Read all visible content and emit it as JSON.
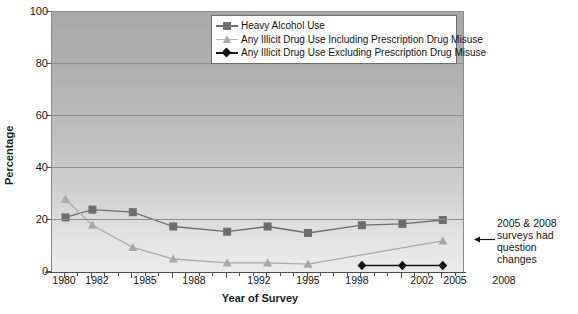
{
  "chart_data": {
    "type": "line",
    "title": "",
    "xlabel": "Year of Survey",
    "ylabel": "Percentage",
    "ylim": [
      0,
      100
    ],
    "yticks": [
      0,
      20,
      40,
      60,
      80,
      100
    ],
    "grid": true,
    "legend_position": "top-center",
    "categories": [
      "1980",
      "1982",
      "1985",
      "1988",
      "1992",
      "1995",
      "1998",
      "2002",
      "2005",
      "2008"
    ],
    "x": [
      1980,
      1982,
      1985,
      1988,
      1992,
      1995,
      1998,
      2002,
      2005,
      2008
    ],
    "series": [
      {
        "name": "Heavy Alcohol Use",
        "marker": "square",
        "color": "#6d6d6d",
        "values": [
          21,
          24,
          23,
          17.5,
          15.5,
          17.5,
          15,
          18,
          18.5,
          20
        ]
      },
      {
        "name": "Any Illicit Drug Use Including Prescription Drug Misuse",
        "marker": "triangle",
        "color": "#a9a9a9",
        "values": [
          28,
          18,
          9.5,
          5,
          3.5,
          3.5,
          3,
          null,
          null,
          12
        ]
      },
      {
        "name": "Any Illicit Drug Use Excluding Prescription Drug Misuse",
        "marker": "diamond",
        "color": "#121212",
        "values": [
          null,
          null,
          null,
          null,
          null,
          null,
          null,
          2.5,
          2.5,
          2.5
        ]
      }
    ],
    "annotations": [
      {
        "text": "2005 & 2008 surveys had question changes",
        "lines": [
          "2005 & 2008",
          "surveys had",
          "question",
          "changes"
        ],
        "points_to": "2008 triangle"
      }
    ]
  },
  "legend": {
    "items": [
      {
        "label": "Heavy Alcohol Use",
        "marker": "square-marker"
      },
      {
        "label": "Any Illicit Drug Use Including Prescription Drug Misuse",
        "marker": "triangle-marker"
      },
      {
        "label": "Any Illicit Drug Use Excluding Prescription Drug Misuse",
        "marker": "diamond-marker"
      }
    ]
  },
  "axes": {
    "y_title": "Percentage",
    "x_title": "Year of Survey",
    "y_labels": [
      "100",
      "80",
      "60",
      "40",
      "20",
      "0"
    ],
    "x_labels": [
      "1980",
      "1982",
      "1985",
      "1988",
      "1992",
      "1995",
      "1998",
      "2002",
      "2005",
      "2008"
    ]
  },
  "annotation": {
    "line1": "2005 & 2008",
    "line2": "surveys had",
    "line3": "question",
    "line4": "changes"
  },
  "colors": {
    "series1": "#6d6d6d",
    "series2": "#a9a9a9",
    "series3": "#121212",
    "gridline": "#8d8d8d",
    "plot_border": "#8a8a8a"
  }
}
